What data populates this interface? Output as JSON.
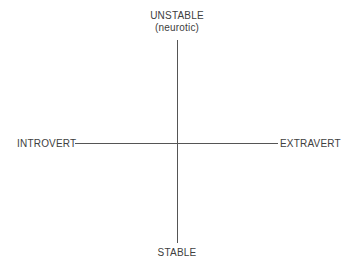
{
  "diagram": {
    "type": "personality-dimensions-quadrant",
    "axes": {
      "vertical": {
        "top_label": "UNSTABLE",
        "top_sublabel": "(neurotic)",
        "bottom_label": "STABLE"
      },
      "horizontal": {
        "left_label": "INTROVERT",
        "right_label": "EXTRAVERT"
      }
    },
    "line_color": "#555555",
    "text_color": "#404040"
  }
}
